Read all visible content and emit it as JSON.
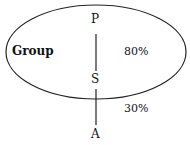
{
  "diagram": {
    "ellipse_label": "Group",
    "nodes": {
      "top": "P",
      "middle": "S",
      "bottom": "A"
    },
    "percentages": {
      "inside": "80%",
      "outside": "30%"
    },
    "colors": {
      "stroke": "#222222",
      "text": "#111111",
      "background": "#ffffff"
    }
  }
}
